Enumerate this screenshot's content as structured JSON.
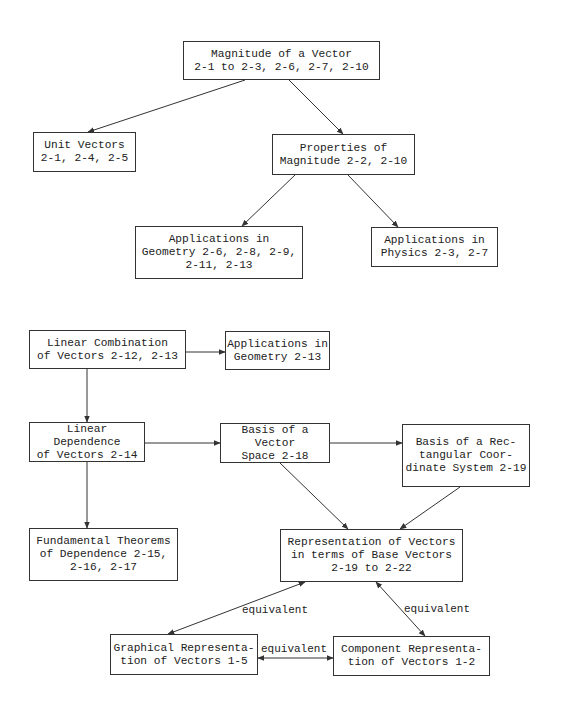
{
  "diagram": {
    "type": "concept-flowchart",
    "nodes": [
      {
        "id": "magnitude",
        "label": "Magnitude of a Vector\n2-1 to 2-3, 2-6, 2-7, 2-10"
      },
      {
        "id": "unit_vectors",
        "label": "Unit Vectors\n2-1, 2-4, 2-5"
      },
      {
        "id": "properties_magnitude",
        "label": "Properties of\nMagnitude 2-2, 2-10"
      },
      {
        "id": "applications_geometry_1",
        "label": "Applications in\nGeometry 2-6, 2-8, 2-9,\n2-11, 2-13"
      },
      {
        "id": "applications_physics",
        "label": "Applications in\nPhysics 2-3, 2-7"
      },
      {
        "id": "linear_combination",
        "label": "Linear Combination\nof Vectors 2-12, 2-13"
      },
      {
        "id": "applications_geometry_2",
        "label": "Applications in\nGeometry 2-13"
      },
      {
        "id": "linear_dependence",
        "label": "Linear Dependence\nof Vectors 2-14"
      },
      {
        "id": "basis_vector_space",
        "label": "Basis of a Vector\nSpace 2-18"
      },
      {
        "id": "basis_rectangular",
        "label": "Basis of a Rec-\ntangular Coor-\ndinate System 2-19"
      },
      {
        "id": "fundamental_theorems",
        "label": "Fundamental Theorems\nof Dependence 2-15,\n2-16, 2-17"
      },
      {
        "id": "representation_base",
        "label": "Representation of Vectors\nin terms of Base Vectors\n2-19 to 2-22"
      },
      {
        "id": "graphical_representation",
        "label": "Graphical Representa-\ntion of Vectors 1-5"
      },
      {
        "id": "component_representation",
        "label": "Component Representa-\ntion of Vectors 1-2"
      }
    ],
    "edges": [
      {
        "from": "magnitude",
        "to": "unit_vectors",
        "label": ""
      },
      {
        "from": "magnitude",
        "to": "properties_magnitude",
        "label": ""
      },
      {
        "from": "properties_magnitude",
        "to": "applications_geometry_1",
        "label": ""
      },
      {
        "from": "properties_magnitude",
        "to": "applications_physics",
        "label": ""
      },
      {
        "from": "linear_combination",
        "to": "applications_geometry_2",
        "label": ""
      },
      {
        "from": "linear_combination",
        "to": "linear_dependence",
        "label": ""
      },
      {
        "from": "linear_dependence",
        "to": "basis_vector_space",
        "label": ""
      },
      {
        "from": "basis_vector_space",
        "to": "basis_rectangular",
        "label": ""
      },
      {
        "from": "linear_dependence",
        "to": "fundamental_theorems",
        "label": ""
      },
      {
        "from": "basis_vector_space",
        "to": "representation_base",
        "label": ""
      },
      {
        "from": "basis_rectangular",
        "to": "representation_base",
        "label": ""
      },
      {
        "from": "graphical_representation",
        "to": "representation_base",
        "label": "equivalent",
        "bidirectional": true
      },
      {
        "from": "component_representation",
        "to": "representation_base",
        "label": "equivalent",
        "bidirectional": true
      },
      {
        "from": "graphical_representation",
        "to": "component_representation",
        "label": "equivalent",
        "bidirectional": true
      }
    ],
    "edge_labels": {
      "graphical_to_representation": "equivalent",
      "component_to_representation": "equivalent",
      "graphical_to_component": "equivalent"
    },
    "colors": {
      "line": "#333333",
      "background": "#ffffff",
      "text": "#222222"
    }
  }
}
